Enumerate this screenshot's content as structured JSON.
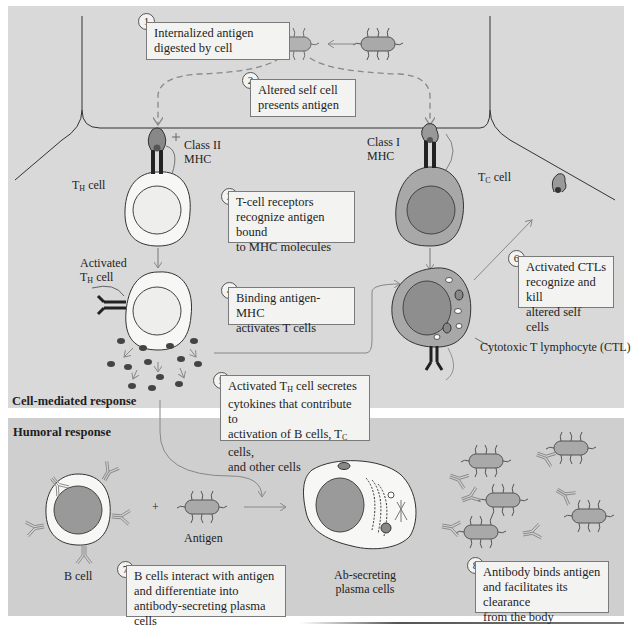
{
  "figure": {
    "sections": {
      "cell_mediated": "Cell-mediated response",
      "humoral": "Humoral response"
    },
    "steps": [
      {
        "num": "1",
        "lines": [
          "Internalized antigen",
          "digested by cell"
        ]
      },
      {
        "num": "2",
        "lines": [
          "Altered self cell",
          "presents antigen"
        ]
      },
      {
        "num": "3",
        "lines": [
          "T-cell receptors",
          "recognize antigen bound",
          "to MHC molecules"
        ]
      },
      {
        "num": "4",
        "lines": [
          "Binding antigen-MHC",
          "activates T cells"
        ]
      },
      {
        "num": "5",
        "line1_pre": "Activated T",
        "line1_sub": "H",
        "line1_post": " cell secretes",
        "line2": "cytokines that contribute to",
        "line3_pre": "activation of B cells, T",
        "line3_sub": "C",
        "line3_post": " cells,",
        "line4": "and other cells"
      },
      {
        "num": "6",
        "lines": [
          "Activated CTLs",
          "recognize and kill",
          "altered self cells"
        ]
      },
      {
        "num": "7",
        "lines": [
          "B cells interact with antigen",
          "and differentiate into",
          "antibody-secreting plasma cells"
        ]
      },
      {
        "num": "8",
        "lines": [
          "Antibody binds antigen",
          "and facilitates its clearance",
          "from the body"
        ]
      }
    ],
    "labels": {
      "class2": [
        "Class II",
        "MHC"
      ],
      "class1": [
        "Class I",
        "MHC"
      ],
      "th_cell_pre": "T",
      "th_cell_sub": "H",
      "th_cell_post": " cell",
      "activated": "Activated",
      "tc_cell_pre": "T",
      "tc_cell_sub": "C",
      "tc_cell_post": " cell",
      "ctl": "Cytotoxic T lymphocyte (CTL)",
      "b_cell": "B cell",
      "plus": "+",
      "antigen": "Antigen",
      "plasma": [
        "Ab-secreting",
        "plasma cells"
      ]
    },
    "colors": {
      "panel_top": "#d9d9d9",
      "panel_bottom": "#cfcfcf",
      "box_fill": "#f3f3f1",
      "cell_fill": "#f7f7f5",
      "nucleus_dark": "#8e8e8e",
      "tc_cytoplasm": "#a8a8a8",
      "arrow": "#8a8a8a"
    }
  }
}
